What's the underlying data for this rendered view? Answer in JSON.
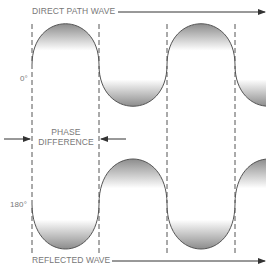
{
  "direct_label": "DIRECT PATH WAVE",
  "reflected_label": "REFLECTED WAVE",
  "phase_label_line1": "PHASE",
  "phase_label_line2": "DIFFERENCE",
  "angle_top": "0°",
  "angle_bottom": "180°",
  "colors": {
    "line": "#555555",
    "fill_dark": "#8a8a8a",
    "text": "#777777"
  }
}
